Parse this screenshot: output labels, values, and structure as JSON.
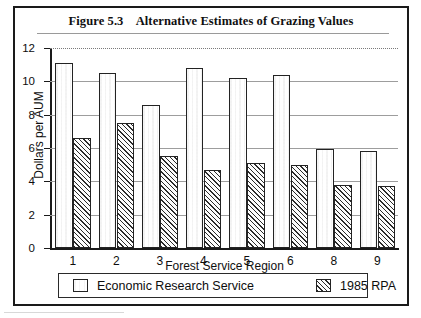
{
  "figure": {
    "frame_border_color": "#1a1a1a",
    "background": "#ffffff"
  },
  "title": "Figure 5.3    Alternative Estimates of Grazing Values",
  "chart_data": {
    "type": "bar",
    "title": "Figure 5.3    Alternative Estimates of Grazing Values",
    "xlabel": "Forest Service Region",
    "ylabel": "Dollars per AUM",
    "categories": [
      "1",
      "2",
      "3",
      "4",
      "5",
      "6",
      "8",
      "9"
    ],
    "series": [
      {
        "name": "Economic Research Service",
        "pattern": "vertical-dotted",
        "color": "#f2f2f2",
        "values": [
          11.1,
          10.5,
          8.6,
          10.8,
          10.2,
          10.4,
          5.95,
          5.8
        ]
      },
      {
        "name": "1985 RPA",
        "pattern": "diagonal-hatch",
        "color": "#ededed",
        "values": [
          6.6,
          7.5,
          5.5,
          4.7,
          5.1,
          5.0,
          3.8,
          3.75
        ]
      }
    ],
    "ylim": [
      0,
      12
    ],
    "yticks": [
      0,
      2,
      4,
      6,
      8,
      10,
      12
    ],
    "ytick_labels": [
      "0",
      "2",
      "4",
      "6",
      "8",
      "10",
      "12"
    ],
    "grid": true,
    "grid_axis": "y",
    "legend_position": "bottom"
  },
  "legend": {
    "items": [
      {
        "label": "Economic Research Service",
        "pattern": "vertical-dotted"
      },
      {
        "label": "1985 RPA",
        "pattern": "diagonal-hatch"
      }
    ]
  }
}
